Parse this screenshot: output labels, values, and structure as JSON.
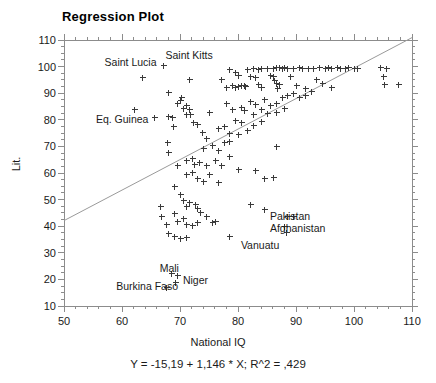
{
  "chart_data": {
    "type": "scatter",
    "title": "Regression Plot",
    "xlabel": "National IQ",
    "ylabel": "Lit.",
    "equation": "Y = -15,19 + 1,146 * X; R^2 = ,429",
    "xlim": [
      50,
      110
    ],
    "ylim": [
      10,
      110
    ],
    "xticks": [
      50,
      60,
      70,
      80,
      90,
      100,
      110
    ],
    "yticks": [
      10,
      20,
      30,
      40,
      50,
      60,
      70,
      80,
      90,
      100,
      110
    ],
    "x_minor_step": 2,
    "y_minor_step": 2.5,
    "grid": false,
    "legend": "none",
    "marker": "plus",
    "regression": {
      "slope": 1.146,
      "intercept": -15.19,
      "r_squared": 0.429,
      "x_start": 50,
      "y_start": 42.1,
      "x_end": 110,
      "y_end": 110.9
    },
    "annotations": [
      {
        "label": "Saint Lucia",
        "x": 57.0,
        "y": 101.5
      },
      {
        "label": "Saint Kitts",
        "x": 67.5,
        "y": 104.0
      },
      {
        "label": "Eq. Guinea",
        "x": 55.5,
        "y": 80.0
      },
      {
        "label": "Pakistan",
        "x": 85.5,
        "y": 43.5
      },
      {
        "label": "Afghanistan",
        "x": 85.5,
        "y": 39.0
      },
      {
        "label": "Vanuatu",
        "x": 80.5,
        "y": 32.5
      },
      {
        "label": "Mali",
        "x": 66.5,
        "y": 24.0
      },
      {
        "label": "Niger",
        "x": 70.5,
        "y": 19.5
      },
      {
        "label": "Burkina Faso",
        "x": 59.0,
        "y": 17.0
      }
    ],
    "points": [
      [
        63.5,
        96.0
      ],
      [
        67.0,
        100.5
      ],
      [
        68.0,
        90.5
      ],
      [
        71.5,
        95.5
      ],
      [
        62.0,
        84.0
      ],
      [
        65.5,
        81.0
      ],
      [
        68.0,
        81.5
      ],
      [
        68.6,
        81.0
      ],
      [
        69.5,
        86.5
      ],
      [
        70.0,
        87.5
      ],
      [
        70.5,
        84.5
      ],
      [
        70.2,
        88.5
      ],
      [
        71.0,
        85.5
      ],
      [
        71.6,
        84.0
      ],
      [
        71.0,
        82.0
      ],
      [
        71.8,
        82.3
      ],
      [
        72.3,
        79.0
      ],
      [
        68.8,
        77.5
      ],
      [
        73.0,
        78.5
      ],
      [
        73.8,
        75.5
      ],
      [
        75.0,
        83.0
      ],
      [
        76.5,
        77.0
      ],
      [
        67.8,
        71.5
      ],
      [
        68.0,
        68.0
      ],
      [
        69.5,
        63.0
      ],
      [
        71.0,
        65.0
      ],
      [
        72.0,
        65.5
      ],
      [
        72.4,
        63.5
      ],
      [
        73.2,
        64.0
      ],
      [
        74.5,
        63.0
      ],
      [
        71.0,
        59.5
      ],
      [
        72.0,
        60.5
      ],
      [
        73.0,
        58.0
      ],
      [
        74.0,
        57.0
      ],
      [
        69.0,
        55.0
      ],
      [
        70.0,
        52.0
      ],
      [
        70.5,
        50.0
      ],
      [
        71.0,
        47.5
      ],
      [
        71.5,
        49.0
      ],
      [
        72.5,
        48.5
      ],
      [
        73.0,
        47.0
      ],
      [
        73.5,
        45.5
      ],
      [
        69.0,
        45.0
      ],
      [
        69.5,
        42.0
      ],
      [
        70.5,
        43.0
      ],
      [
        71.0,
        41.0
      ],
      [
        72.0,
        40.5
      ],
      [
        73.0,
        41.5
      ],
      [
        74.5,
        44.0
      ],
      [
        75.5,
        41.5
      ],
      [
        66.5,
        47.5
      ],
      [
        66.8,
        44.0
      ],
      [
        67.5,
        41.0
      ],
      [
        68.0,
        37.5
      ],
      [
        69.0,
        36.5
      ],
      [
        70.0,
        35.5
      ],
      [
        71.0,
        36.0
      ],
      [
        68.5,
        22.5
      ],
      [
        69.5,
        21.5
      ],
      [
        69.2,
        19.0
      ],
      [
        67.5,
        17.0
      ],
      [
        76.0,
        42.0
      ],
      [
        78.5,
        36.5
      ],
      [
        80.0,
        61.5
      ],
      [
        83.0,
        61.0
      ],
      [
        84.5,
        58.0
      ],
      [
        86.0,
        58.5
      ],
      [
        86.5,
        70.0
      ],
      [
        82.0,
        48.5
      ],
      [
        84.5,
        46.5
      ],
      [
        88.5,
        44.0
      ],
      [
        89.5,
        44.0
      ],
      [
        88.0,
        40.0
      ],
      [
        88.2,
        38.0
      ],
      [
        78.5,
        99.0
      ],
      [
        79.5,
        98.0
      ],
      [
        80.0,
        97.0
      ],
      [
        77.0,
        95.5
      ],
      [
        78.0,
        92.5
      ],
      [
        79.0,
        93.0
      ],
      [
        79.5,
        92.5
      ],
      [
        80.0,
        92.8
      ],
      [
        80.5,
        93.0
      ],
      [
        81.0,
        93.2
      ],
      [
        81.2,
        92.6
      ],
      [
        81.5,
        99.0
      ],
      [
        82.5,
        99.5
      ],
      [
        83.5,
        99.2
      ],
      [
        84.0,
        99.5
      ],
      [
        82.0,
        96.5
      ],
      [
        83.0,
        96.0
      ],
      [
        83.5,
        93.5
      ],
      [
        84.0,
        92.5
      ],
      [
        85.0,
        99.5
      ],
      [
        86.0,
        99.5
      ],
      [
        86.5,
        99.8
      ],
      [
        87.0,
        100.0
      ],
      [
        87.5,
        99.5
      ],
      [
        88.0,
        100.0
      ],
      [
        85.5,
        97.0
      ],
      [
        86.0,
        96.5
      ],
      [
        86.2,
        95.0
      ],
      [
        86.5,
        94.0
      ],
      [
        87.0,
        93.5
      ],
      [
        86.8,
        92.0
      ],
      [
        88.5,
        99.5
      ],
      [
        89.5,
        99.5
      ],
      [
        90.5,
        99.8
      ],
      [
        91.0,
        99.5
      ],
      [
        89.0,
        96.5
      ],
      [
        90.0,
        93.0
      ],
      [
        91.5,
        92.0
      ],
      [
        92.0,
        99.5
      ],
      [
        93.0,
        99.5
      ],
      [
        94.0,
        99.8
      ],
      [
        95.0,
        99.5
      ],
      [
        95.5,
        99.8
      ],
      [
        96.0,
        99.5
      ],
      [
        97.0,
        99.8
      ],
      [
        97.5,
        99.5
      ],
      [
        98.5,
        99.5
      ],
      [
        99.0,
        99.8
      ],
      [
        100.0,
        99.5
      ],
      [
        100.5,
        99.5
      ],
      [
        93.5,
        95.5
      ],
      [
        94.5,
        94.0
      ],
      [
        96.0,
        92.5
      ],
      [
        104.5,
        100.0
      ],
      [
        105.5,
        99.5
      ],
      [
        105.0,
        96.5
      ],
      [
        105.2,
        93.5
      ],
      [
        107.5,
        93.5
      ],
      [
        82.0,
        87.0
      ],
      [
        83.0,
        86.0
      ],
      [
        84.5,
        88.0
      ],
      [
        85.5,
        85.5
      ],
      [
        86.5,
        86.5
      ],
      [
        87.5,
        88.5
      ],
      [
        88.5,
        89.5
      ],
      [
        89.5,
        90.0
      ],
      [
        90.5,
        88.5
      ],
      [
        91.5,
        89.5
      ],
      [
        92.5,
        91.0
      ],
      [
        80.5,
        85.0
      ],
      [
        81.0,
        83.5
      ],
      [
        82.5,
        82.0
      ],
      [
        84.0,
        84.0
      ],
      [
        85.0,
        82.5
      ],
      [
        86.5,
        83.0
      ],
      [
        88.0,
        84.5
      ],
      [
        78.0,
        86.5
      ],
      [
        79.0,
        84.0
      ],
      [
        79.5,
        80.0
      ],
      [
        80.5,
        79.0
      ],
      [
        77.5,
        77.5
      ],
      [
        78.5,
        75.0
      ],
      [
        80.0,
        74.5
      ],
      [
        81.5,
        76.0
      ],
      [
        82.5,
        78.0
      ],
      [
        84.0,
        79.5
      ],
      [
        75.5,
        70.5
      ],
      [
        76.5,
        68.5
      ],
      [
        77.5,
        71.5
      ],
      [
        78.5,
        72.0
      ],
      [
        76.0,
        65.0
      ],
      [
        77.0,
        63.0
      ],
      [
        78.5,
        66.5
      ],
      [
        74.0,
        69.5
      ],
      [
        74.5,
        73.0
      ],
      [
        75.0,
        59.5
      ],
      [
        76.5,
        56.5
      ]
    ]
  }
}
